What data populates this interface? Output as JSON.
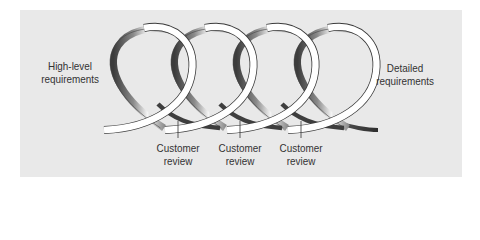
{
  "diagram": {
    "type": "spiral-iteration",
    "start_label": "High-level requirements",
    "end_label": "Detailed requirements",
    "loops": 4,
    "reviews": [
      {
        "label_line1": "Customer",
        "label_line2": "review"
      },
      {
        "label_line1": "Customer",
        "label_line2": "review"
      },
      {
        "label_line1": "Customer",
        "label_line2": "review"
      }
    ],
    "colors": {
      "background": "#e9e9e9",
      "ribbon_light": "#ffffff",
      "ribbon_dark": "#555555",
      "text": "#333333"
    }
  }
}
